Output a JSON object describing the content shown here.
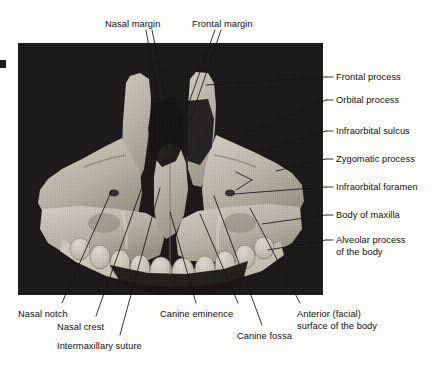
{
  "figure": {
    "photo": {
      "x": 18,
      "y": 43,
      "width": 305,
      "height": 252,
      "background_color": "#171514"
    },
    "bone_color": "#cfc9bd",
    "line_color": "#1a1a1a"
  },
  "labels": {
    "top": [
      {
        "id": "nasal-margin",
        "text": "Nasal margin",
        "x": 105,
        "y": 19
      },
      {
        "id": "frontal-margin",
        "text": "Frontal margin",
        "x": 192,
        "y": 19
      }
    ],
    "right": [
      {
        "id": "frontal-process",
        "text": "Frontal process",
        "x": 336,
        "y": 72
      },
      {
        "id": "orbital-process",
        "text": "Orbital process",
        "x": 336,
        "y": 95
      },
      {
        "id": "infraorbital-sulcus",
        "text": "Infraorbital sulcus",
        "x": 336,
        "y": 126
      },
      {
        "id": "zygomatic-process",
        "text": "Zygomatic process",
        "x": 336,
        "y": 154
      },
      {
        "id": "infraorbital-foramen",
        "text": "Infraorbital foramen",
        "x": 336,
        "y": 182
      },
      {
        "id": "body-of-maxilla",
        "text": "Body of maxilla",
        "x": 336,
        "y": 210
      },
      {
        "id": "alveolar-process",
        "text": "Alveolar process of the body",
        "line1": "Alveolar process",
        "line2": "of the body",
        "x": 336,
        "y": 235
      }
    ],
    "bottom": [
      {
        "id": "nasal-notch",
        "text": "Nasal notch",
        "x": 18,
        "y": 309
      },
      {
        "id": "nasal-crest",
        "text": "Nasal crest",
        "x": 57,
        "y": 322
      },
      {
        "id": "intermaxillary-suture",
        "text": "Intermaxillary suture",
        "x": 57,
        "y": 341
      },
      {
        "id": "canine-eminence",
        "text": "Canine eminence",
        "x": 160,
        "y": 309
      },
      {
        "id": "canine-fossa",
        "text": "Canine fossa",
        "x": 237,
        "y": 331
      },
      {
        "id": "anterior-facial-surface",
        "text": "Anterior (facial) surface of the body",
        "line1": "Anterior (facial)",
        "line2": "surface of the body",
        "x": 297,
        "y": 309
      }
    ]
  },
  "ghost_text": {
    "a": "",
    "b": ""
  }
}
